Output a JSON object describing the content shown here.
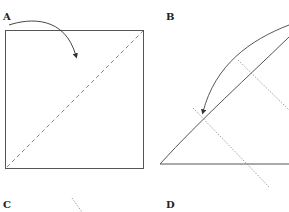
{
  "panels": {
    "A": {
      "label": "A"
    },
    "B": {
      "label": "B"
    },
    "C": {
      "label": "C"
    },
    "D": {
      "label": "D"
    }
  },
  "colors": {
    "line": "#555555",
    "dashed": "#666666",
    "dotted": "#888888",
    "label": "#222222"
  }
}
